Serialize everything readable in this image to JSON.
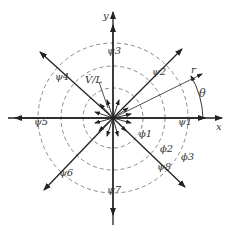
{
  "diagram": {
    "axes": {
      "x_label": "x",
      "y_label": "y",
      "r_label": "r",
      "angle_label": "θ"
    },
    "source_label": "V̇/L",
    "stream_labels": [
      "ψ1",
      "ψ2",
      "ψ3",
      "ψ4",
      "ψ5",
      "ψ6",
      "ψ7",
      "ψ8"
    ],
    "potential_labels": [
      "ϕ1",
      "ϕ2",
      "ϕ3"
    ],
    "colors": {
      "line": "#222222",
      "dashed": "#888888",
      "background": "#ffffff"
    }
  }
}
